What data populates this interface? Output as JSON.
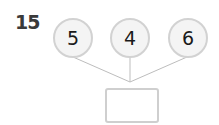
{
  "problem": {
    "number": "15",
    "numbers": [
      "5",
      "4",
      "6"
    ],
    "answer_box": ""
  }
}
